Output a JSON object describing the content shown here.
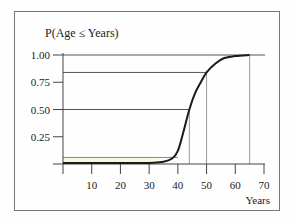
{
  "chart_data": {
    "type": "line",
    "title": "P(Age ≤ Years)",
    "xlabel": "Years",
    "ylabel": "",
    "xlim": [
      0,
      70
    ],
    "ylim": [
      0,
      1
    ],
    "x_ticks": [
      10,
      20,
      30,
      40,
      50,
      60,
      70
    ],
    "y_ticks": [
      0.25,
      0.5,
      0.75,
      1.0
    ],
    "y_tick_labels": [
      "0.25",
      "0.50",
      "0.75",
      "1.00"
    ],
    "x_tick_labels": [
      "10",
      "20",
      "30",
      "40",
      "50",
      "60",
      "70"
    ],
    "grid": false,
    "series": [
      {
        "name": "Cumulative distribution of age",
        "description": "S-shaped CDF, approximately normal with mean 44 and sd 6",
        "x": [
          0,
          10,
          20,
          30,
          35,
          38,
          40,
          42,
          44,
          46,
          48,
          50,
          53,
          56,
          60,
          65
        ],
        "values": [
          0.0,
          0.0,
          0.0,
          0.01,
          0.02,
          0.05,
          0.12,
          0.3,
          0.5,
          0.65,
          0.75,
          0.84,
          0.92,
          0.97,
          0.99,
          1.0
        ]
      }
    ],
    "reference_lines": [
      {
        "type": "horizontal",
        "y": 1.0,
        "from_x": 0,
        "to_x": 70
      },
      {
        "type": "horizontal",
        "y": 0.84,
        "from_x": 0,
        "to_x": 50
      },
      {
        "type": "horizontal",
        "y": 0.5,
        "from_x": 0,
        "to_x": 44
      },
      {
        "type": "horizontal",
        "y": 0.06,
        "from_x": 0,
        "to_x": 40
      },
      {
        "type": "vertical",
        "x": 44,
        "from_y": 0,
        "to_y": 0.5
      },
      {
        "type": "vertical",
        "x": 50,
        "from_y": 0,
        "to_y": 0.84
      },
      {
        "type": "vertical",
        "x": 65,
        "from_y": 0,
        "to_y": 1.0
      }
    ],
    "colors": {
      "curve": "#1a1a1a",
      "reference": "#555555",
      "dropline": "#999999",
      "frame": "#777777",
      "band": "#f4f0c8"
    }
  }
}
